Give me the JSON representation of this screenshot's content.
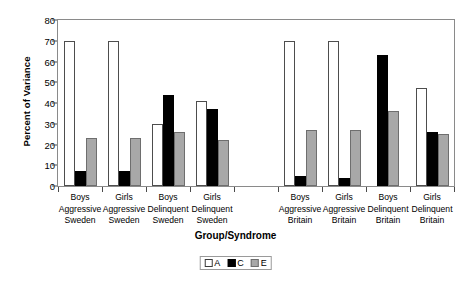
{
  "chart_data": {
    "type": "bar",
    "title": "",
    "xlabel": "Group/Syndrome",
    "ylabel": "Percent of Variance",
    "ylim": [
      0,
      80
    ],
    "yticks": [
      0,
      10,
      20,
      30,
      40,
      50,
      60,
      70,
      80
    ],
    "grid": false,
    "legend_position": "bottom",
    "categories": [
      "Boys Aggressive Sweden",
      "Girls Aggressive Sweden",
      "Boys Delinquent Sweden",
      "Girls Delinquent Sweden",
      "",
      "Boys Aggressive Britain",
      "Girls Aggressive Britain",
      "Boys Delinquent Britain",
      "Girls Delinquent Britain"
    ],
    "category_lines": [
      [
        "Boys",
        "Aggressive",
        "Sweden"
      ],
      [
        "Girls",
        "Aggressive",
        "Sweden"
      ],
      [
        "Boys",
        "Delinquent",
        "Sweden"
      ],
      [
        "Girls",
        "Delinquent",
        "Sweden"
      ],
      [
        "",
        "",
        ""
      ],
      [
        "Boys",
        "Aggressive",
        "Britain"
      ],
      [
        "Girls",
        "Aggressive",
        "Britain"
      ],
      [
        "Boys",
        "Delinquent",
        "Britain"
      ],
      [
        "Girls",
        "Delinquent",
        "Britain"
      ]
    ],
    "series": [
      {
        "name": "A",
        "color": "#ffffff",
        "values": [
          70,
          70,
          30,
          41,
          null,
          70,
          70,
          0,
          47
        ]
      },
      {
        "name": "C",
        "color": "#000000",
        "values": [
          7,
          7,
          44,
          37,
          null,
          5,
          4,
          63,
          26
        ]
      },
      {
        "name": "E",
        "color": "#a8a8a8",
        "values": [
          23,
          23,
          26,
          22,
          null,
          27,
          27,
          36,
          25
        ]
      }
    ]
  },
  "legend": {
    "items": [
      {
        "key": "A",
        "label": "A"
      },
      {
        "key": "C",
        "label": "C"
      },
      {
        "key": "E",
        "label": "E"
      }
    ]
  }
}
